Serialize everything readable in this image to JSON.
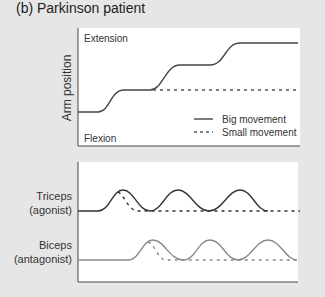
{
  "title": "(b) Parkinson patient",
  "top_panel": {
    "ylabel": "Arm position",
    "top_label": "Extension",
    "bottom_label": "Flexion",
    "legend": [
      {
        "label": "Big movement",
        "style": "solid"
      },
      {
        "label": "Small movement",
        "style": "dashed"
      }
    ]
  },
  "bottom_panel": {
    "rows": [
      {
        "name": "Triceps",
        "role": "(agonist)",
        "color": "#333333"
      },
      {
        "name": "Biceps",
        "role": "(antagonist)",
        "color": "#8a8a8a"
      }
    ]
  },
  "colors": {
    "background": "#e6e6e6",
    "panel": "#ffffff",
    "dark_line": "#333333",
    "gray_line": "#8a8a8a"
  }
}
